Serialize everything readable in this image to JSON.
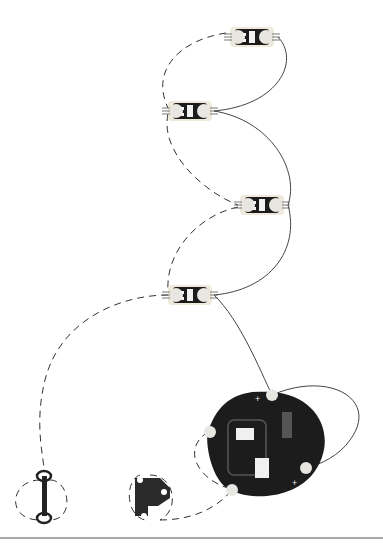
{
  "diagram": {
    "type": "circuit-sewing-diagram",
    "colors": {
      "background": "#ffffff",
      "board": "#1c1c1c",
      "thread_solid": "#444444",
      "thread_dashed": "#333333",
      "pad": "#e8e6e0",
      "led": "#f2f2f2",
      "divider": "#555555"
    },
    "components": [
      {
        "id": "led-1",
        "kind": "LED sequin",
        "icon": "led-sequin-icon",
        "x": 252,
        "y": 37
      },
      {
        "id": "led-2",
        "kind": "LED sequin",
        "icon": "led-sequin-icon",
        "x": 190,
        "y": 111
      },
      {
        "id": "led-3",
        "kind": "LED sequin",
        "icon": "led-sequin-icon",
        "x": 262,
        "y": 205
      },
      {
        "id": "led-4",
        "kind": "LED sequin",
        "icon": "led-sequin-icon",
        "x": 190,
        "y": 295
      },
      {
        "id": "battery-holder",
        "kind": "Coin cell battery board",
        "icon": "battery-board-icon",
        "x": 262,
        "y": 445
      },
      {
        "id": "snap-hook",
        "kind": "Hook-and-eye clasp (hook)",
        "icon": "hook-icon",
        "x": 150,
        "y": 492
      },
      {
        "id": "snap-eye",
        "kind": "Hook-and-eye clasp (eye)",
        "icon": "eye-icon",
        "x": 44,
        "y": 495
      }
    ],
    "labels": {
      "plus_top": "+",
      "plus_bottom": "+",
      "minus": "-"
    }
  }
}
